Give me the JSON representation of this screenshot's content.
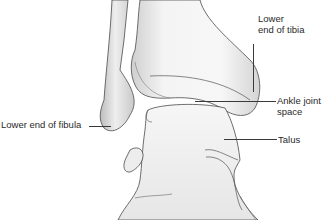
{
  "diagram": {
    "labels": {
      "tibia_line1": "Lower",
      "tibia_line2": "end of tibia",
      "fibula": "Lower end of fibula",
      "joint_line1": "Ankle joint",
      "joint_line2": "space",
      "talus": "Talus"
    },
    "colors": {
      "bone_fill": "#f2f2f2",
      "bone_shade": "#c8c8c8",
      "outline": "#4a4a4a",
      "text": "#2a2a2a",
      "background": "#ffffff"
    }
  }
}
